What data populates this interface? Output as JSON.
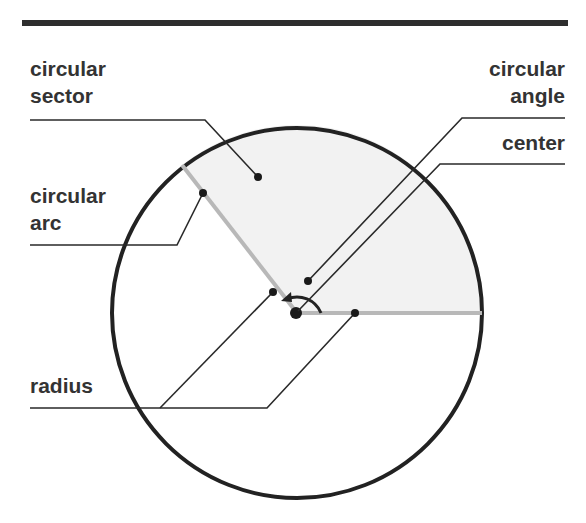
{
  "diagram": {
    "colors": {
      "rule": "#2e2e2e",
      "circle": "#222222",
      "radius_lines": "#b8b8b8",
      "sector_fill": "#f2f2f2",
      "leader_lines": "#2a2a2a",
      "text": "#333333"
    },
    "labels": {
      "sector": {
        "line1": "circular",
        "line2": "sector"
      },
      "angle": {
        "line1": "circular",
        "line2": "angle"
      },
      "center": {
        "line1": "center"
      },
      "arc": {
        "line1": "circular",
        "line2": "arc"
      },
      "radius": {
        "line1": "radius"
      }
    },
    "geometry": {
      "circle": {
        "cx": 297,
        "cy": 313,
        "r": 185
      },
      "radius_endpoint_left": [
        182,
        165
      ],
      "radius_endpoint_right": [
        481,
        313
      ]
    }
  }
}
